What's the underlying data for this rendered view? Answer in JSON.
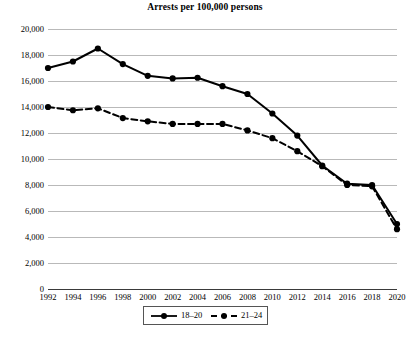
{
  "chart_data": {
    "type": "line",
    "title": "Arrests per 100,000 persons",
    "xlabel": "",
    "ylabel": "",
    "x": [
      1992,
      1994,
      1996,
      1998,
      2000,
      2002,
      2004,
      2006,
      2008,
      2010,
      2012,
      2014,
      2016,
      2018,
      2020
    ],
    "categories": [
      "1992",
      "1994",
      "1996",
      "1998",
      "2000",
      "2002",
      "2004",
      "2006",
      "2008",
      "2010",
      "2012",
      "2014",
      "2016",
      "2018",
      "2020"
    ],
    "xlim": [
      1992,
      2020
    ],
    "ylim": [
      0,
      20000
    ],
    "ytick_values": [
      0,
      2000,
      4000,
      6000,
      8000,
      10000,
      12000,
      14000,
      16000,
      18000,
      20000
    ],
    "ytick_labels": [
      "0",
      "2,000",
      "4,000",
      "6,000",
      "8,000",
      "10,000",
      "12,000",
      "14,000",
      "16,000",
      "18,000",
      "20,000"
    ],
    "grid": true,
    "grid_axis": "y",
    "legend_position": "bottom-center",
    "series": [
      {
        "name": "18–20",
        "style": "solid",
        "marker": "filled-circle",
        "color": "#000000",
        "values": [
          17000,
          17500,
          18500,
          17300,
          16400,
          16200,
          16250,
          15600,
          15000,
          13500,
          11800,
          9500,
          8100,
          8000,
          5000
        ]
      },
      {
        "name": "21–24",
        "style": "dashed",
        "marker": "filled-circle",
        "color": "#000000",
        "values": [
          14000,
          13750,
          13900,
          13150,
          12900,
          12700,
          12700,
          12700,
          12200,
          11600,
          10600,
          9450,
          8000,
          7900,
          4600
        ]
      }
    ]
  },
  "legend": {
    "entries": [
      {
        "label": "18–20"
      },
      {
        "label": "21–24"
      }
    ]
  }
}
